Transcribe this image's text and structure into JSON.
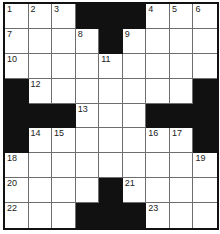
{
  "puzzle": {
    "rows": 9,
    "cols": 9,
    "colors": {
      "block": "#111111",
      "cell": "#ffffff",
      "grid_line": "#6e6e6e",
      "number": "#222222"
    },
    "layout": [
      "...###...",
      "....#....",
      ".........",
      "#.......#",
      "###...###",
      "#.......#",
      ".........",
      "....#....",
      "...###..."
    ],
    "numbers": [
      {
        "row": 0,
        "col": 0,
        "n": "1"
      },
      {
        "row": 0,
        "col": 1,
        "n": "2"
      },
      {
        "row": 0,
        "col": 2,
        "n": "3"
      },
      {
        "row": 0,
        "col": 6,
        "n": "4"
      },
      {
        "row": 0,
        "col": 7,
        "n": "5"
      },
      {
        "row": 0,
        "col": 8,
        "n": "6"
      },
      {
        "row": 1,
        "col": 0,
        "n": "7"
      },
      {
        "row": 1,
        "col": 3,
        "n": "8"
      },
      {
        "row": 1,
        "col": 5,
        "n": "9"
      },
      {
        "row": 2,
        "col": 0,
        "n": "10"
      },
      {
        "row": 2,
        "col": 4,
        "n": "11"
      },
      {
        "row": 3,
        "col": 1,
        "n": "12"
      },
      {
        "row": 4,
        "col": 3,
        "n": "13"
      },
      {
        "row": 5,
        "col": 1,
        "n": "14"
      },
      {
        "row": 5,
        "col": 2,
        "n": "15"
      },
      {
        "row": 5,
        "col": 6,
        "n": "16"
      },
      {
        "row": 5,
        "col": 7,
        "n": "17"
      },
      {
        "row": 6,
        "col": 0,
        "n": "18"
      },
      {
        "row": 6,
        "col": 8,
        "n": "19"
      },
      {
        "row": 7,
        "col": 0,
        "n": "20"
      },
      {
        "row": 7,
        "col": 5,
        "n": "21"
      },
      {
        "row": 8,
        "col": 0,
        "n": "22"
      },
      {
        "row": 8,
        "col": 6,
        "n": "23"
      }
    ],
    "cells": [
      [
        "1",
        "2",
        "3",
        "#",
        "#",
        "#",
        "4",
        "5",
        "6"
      ],
      [
        "7",
        "",
        "",
        "8",
        "#",
        "9",
        "",
        "",
        ""
      ],
      [
        "10",
        "",
        "",
        "",
        "11",
        "",
        "",
        "",
        ""
      ],
      [
        "#",
        "12",
        "",
        "",
        "",
        "",
        "",
        "",
        "#"
      ],
      [
        "#",
        "#",
        "#",
        "13",
        "",
        "",
        "#",
        "#",
        "#"
      ],
      [
        "#",
        "14",
        "15",
        "",
        "",
        "",
        "16",
        "17",
        "#"
      ],
      [
        "18",
        "",
        "",
        "",
        "",
        "",
        "",
        "",
        "19"
      ],
      [
        "20",
        "",
        "",
        "",
        "#",
        "21",
        "",
        "",
        ""
      ],
      [
        "22",
        "",
        "",
        "#",
        "#",
        "#",
        "23",
        "",
        ""
      ]
    ]
  }
}
